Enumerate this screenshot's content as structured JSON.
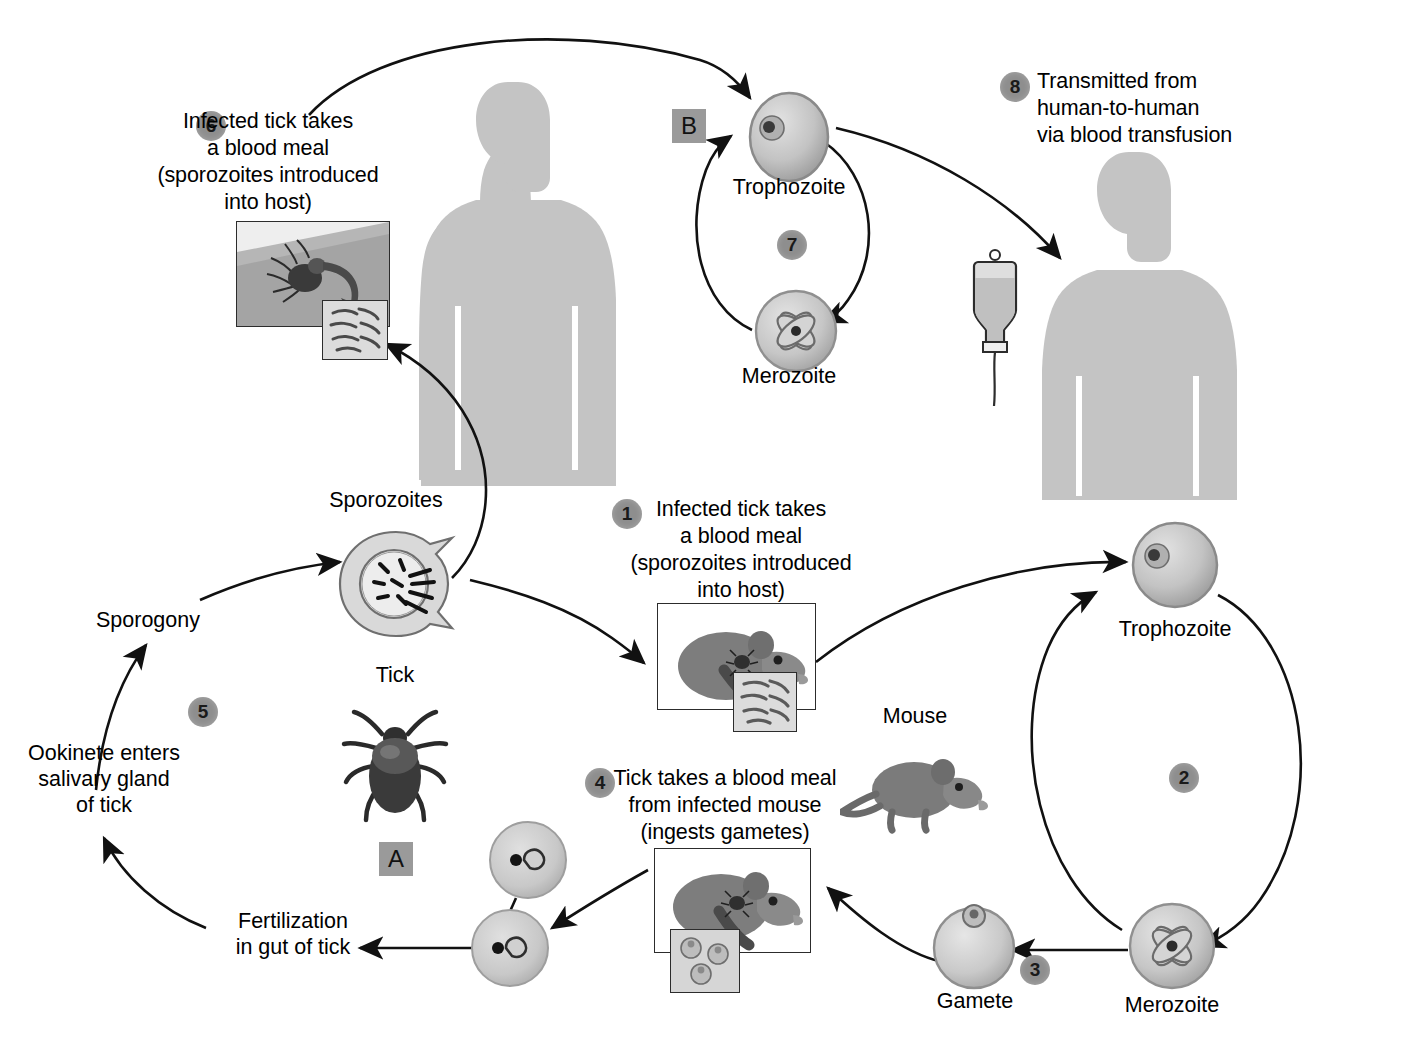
{
  "diagram": {
    "background_color": "#ffffff",
    "silhouette_color": "#c4c4c4",
    "badge_color": "#8e8e8e",
    "tile_color": "#9a9a9a",
    "line_color": "#111111"
  },
  "steps": [
    {
      "id": "1",
      "number": "1",
      "text": "Infected tick takes\na blood meal\n(sporozoites introduced\ninto host)"
    },
    {
      "id": "2",
      "number": "2",
      "text": ""
    },
    {
      "id": "3",
      "number": "3",
      "text": ""
    },
    {
      "id": "4",
      "number": "4",
      "text": "Tick takes a blood meal\nfrom infected mouse\n(ingests gametes)"
    },
    {
      "id": "5",
      "number": "5",
      "text": ""
    },
    {
      "id": "6",
      "number": "6",
      "text": "Infected tick takes\na blood meal\n(sporozoites introduced\ninto host)"
    },
    {
      "id": "7",
      "number": "7",
      "text": ""
    },
    {
      "id": "8",
      "number": "8",
      "text": "Transmitted from\nhuman-to-human\nvia blood transfusion"
    }
  ],
  "tiles": [
    {
      "id": "A",
      "letter": "A"
    },
    {
      "id": "B",
      "letter": "B"
    }
  ],
  "labels": {
    "sporozoites": "Sporozoites",
    "sporogony": "Sporogony",
    "tick": "Tick",
    "mouse": "Mouse",
    "gamete": "Gamete",
    "merozoite_bottom": "Merozoite",
    "trophozoite_bottom": "Trophozoite",
    "merozoite_top": "Merozoite",
    "trophozoite_top": "Trophozoite",
    "ookinete": "Ookinete enters\nsalivary gland\nof tick",
    "fertilization": "Fertilization\nin gut of tick"
  },
  "organisms": {
    "human_host": "human-silhouette",
    "human_recipient": "human-silhouette",
    "transfusion_bag": "iv-drip-bag",
    "tick": "tick-illustration",
    "mouse": "mouse-illustration"
  }
}
